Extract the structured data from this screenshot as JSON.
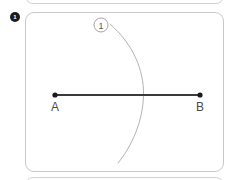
{
  "figure": {
    "step_badge": {
      "label": "1",
      "icon": "step-number-badge",
      "background_color": "#1c1c1c",
      "text_color": "#ffffff"
    },
    "card": {
      "border_color": "#c9c9c9",
      "background_color": "#ffffff"
    },
    "segment": {
      "name": "segment-ab",
      "stroke_color": "#3a3a3a",
      "start": {
        "label": "A",
        "x": 55,
        "y": 95
      },
      "end": {
        "label": "B",
        "x": 200,
        "y": 95
      }
    },
    "arc": {
      "name": "compass-arc-1",
      "stroke_color": "#a9a9a9",
      "start": {
        "x": 110,
        "y": 24
      },
      "crossing": {
        "x": 143,
        "y": 95
      },
      "end": {
        "x": 118,
        "y": 163
      }
    },
    "callout": {
      "label": "1",
      "x": 101,
      "y": 25,
      "stroke_color": "#9a9a9a",
      "text_color": "#555555"
    },
    "labels": {
      "point_a": "A",
      "point_b": "B",
      "color": "#4a4a4a"
    }
  }
}
